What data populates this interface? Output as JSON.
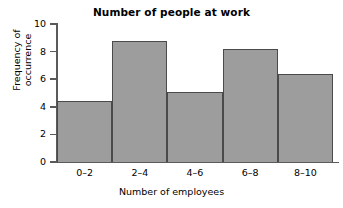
{
  "chart_data": {
    "type": "bar",
    "title": "Number of people at work",
    "subtitle": "",
    "xlabel": "Number of employees",
    "ylabel": "Frequency of occurrence",
    "ylabel_lines": [
      "Frequency of",
      "occurrence"
    ],
    "categories": [
      "0–2",
      "2–4",
      "4–6",
      "6–8",
      "8–10"
    ],
    "values": [
      4.4,
      8.8,
      5.1,
      8.2,
      6.4
    ],
    "ylim": [
      0,
      10
    ],
    "yticks": [
      0,
      2,
      4,
      6,
      8,
      10
    ],
    "ytick_labels": [
      "0",
      "2",
      "4",
      "6",
      "8",
      "10"
    ],
    "grid": false,
    "legend": null,
    "bar_gap": 0,
    "colors": {
      "bar_fill": "#9d9d9d",
      "bar_edge": "#4a4a4a",
      "axis": "#5a5a5a",
      "text": "#000000",
      "background": "#ffffff"
    }
  }
}
